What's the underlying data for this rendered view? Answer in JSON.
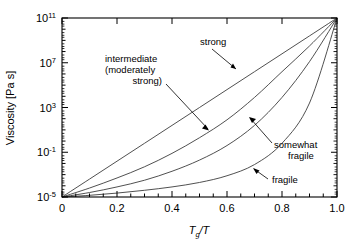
{
  "chart_data": {
    "type": "line",
    "title": "",
    "xlabel": "Tg/T",
    "ylabel": "Viscosity [Pa s]",
    "xlim": [
      0,
      1.0
    ],
    "ylim_log10": [
      -5,
      11
    ],
    "yscale": "log",
    "grid": false,
    "legend": "none (inline annotations with arrows)",
    "xticks": [
      "0",
      "0.2",
      "0.4",
      "0.6",
      "0.8",
      "1.0"
    ],
    "xtick_values": [
      0,
      0.2,
      0.4,
      0.6,
      0.8,
      1.0
    ],
    "yticks": [
      "10^-5",
      "10^-1",
      "10^3",
      "10^7",
      "10^11"
    ],
    "ytick_exponents": [
      -5,
      -1,
      3,
      7,
      11
    ],
    "x": [
      0,
      0.1,
      0.2,
      0.3,
      0.4,
      0.5,
      0.6,
      0.7,
      0.8,
      0.9,
      1.0
    ],
    "series": [
      {
        "name": "strong",
        "description": "Arrhenius, nearly straight line on log viscosity vs Tg/T",
        "log10_values": [
          -5.0,
          -3.4,
          -1.8,
          -0.2,
          1.4,
          3.0,
          4.6,
          6.2,
          7.8,
          9.4,
          11.0
        ]
      },
      {
        "name": "intermediate (moderately strong)",
        "description": "mildly curved, slightly below the strong line",
        "log10_values": [
          -5.0,
          -4.2,
          -3.3,
          -2.3,
          -1.1,
          0.3,
          1.9,
          3.9,
          6.2,
          8.5,
          11.0
        ]
      },
      {
        "name": "somewhat fragile",
        "description": "more convex, super-Arrhenius",
        "log10_values": [
          -5.0,
          -4.6,
          -4.1,
          -3.5,
          -2.7,
          -1.7,
          -0.4,
          1.4,
          3.9,
          7.1,
          11.0
        ]
      },
      {
        "name": "fragile",
        "description": "strongly convex, flat until Tg/T ~ 0.7 then sharp rise",
        "log10_values": [
          -5.0,
          -4.85,
          -4.65,
          -4.4,
          -4.1,
          -3.7,
          -3.1,
          -2.1,
          -0.2,
          3.4,
          11.0
        ]
      }
    ],
    "annotations": [
      {
        "text": "strong",
        "label_x": 0.53,
        "label_y_log10": 9.1,
        "arrow_to_x": 0.635,
        "arrow_to_y_log10": 7.1,
        "points_to_series": "strong"
      },
      {
        "text_lines": [
          "intermediate",
          "(moderately",
          "strong)"
        ],
        "label_x": 0.175,
        "label_y_log10": 7.4,
        "arrow_to_x": 0.52,
        "arrow_to_y_log10": 2.1,
        "points_to_series": "intermediate (moderately strong)"
      },
      {
        "text_lines": [
          "somewhat",
          "fragile"
        ],
        "label_x": 0.88,
        "label_y_log10": 0.35,
        "arrow_to_x": 0.745,
        "arrow_to_y_log10": 2.5,
        "points_to_series": "somewhat fragile"
      },
      {
        "text": "fragile",
        "label_x": 0.875,
        "label_y_log10": -3.6,
        "arrow_to_x": 0.7,
        "arrow_to_y_log10": -2.85,
        "points_to_series": "fragile"
      }
    ],
    "colors": {
      "curve": "#3c3c3c",
      "axis": "#000000",
      "text": "#000000",
      "background": "#ffffff"
    }
  },
  "axis": {
    "y_title": "Viscosity [Pa s]",
    "x_title_main": "T",
    "x_title_sub": "g",
    "x_title_rest": "/T",
    "y_tick_labels": [
      {
        "mantissa": "10",
        "exp": "11"
      },
      {
        "mantissa": "10",
        "exp": "7"
      },
      {
        "mantissa": "10",
        "exp": "3"
      },
      {
        "mantissa": "10",
        "exp": "-1"
      },
      {
        "mantissa": "10",
        "exp": "-5"
      }
    ],
    "x_tick_labels": [
      "0",
      "0.2",
      "0.4",
      "0.6",
      "0.8",
      "1.0"
    ]
  },
  "labels": {
    "strong": "strong",
    "intermediate_l1": "intermediate",
    "intermediate_l2": "(moderately",
    "intermediate_l3": "strong)",
    "somewhat_l1": "somewhat",
    "somewhat_l2": "fragile",
    "fragile": "fragile"
  }
}
